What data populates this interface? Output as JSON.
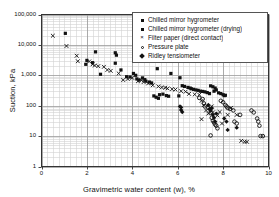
{
  "chart_data": {
    "type": "scatter",
    "title": "",
    "xlabel": "Gravimetric water content (w), %",
    "ylabel": "Suction, kPa",
    "xlim": [
      0,
      10
    ],
    "ylim": [
      1,
      100000
    ],
    "yscale": "log",
    "xscale": "linear",
    "grid": true,
    "grid_minor": true,
    "legend_position": "top-right",
    "xticks": [
      "0",
      "2",
      "4",
      "6",
      "8",
      "10"
    ],
    "xtick_values": [
      0,
      2,
      4,
      6,
      8,
      10
    ],
    "yticks": [
      "1",
      "10",
      "100",
      "1,000",
      "10,000",
      "100,000"
    ],
    "ytick_values": [
      1,
      10,
      100,
      1000,
      10000,
      100000
    ],
    "series": [
      {
        "name": "Chilled mirror hygrometer",
        "marker": "filled-square",
        "color": "#111111",
        "points": [
          [
            1.05,
            24000
          ],
          [
            2.38,
            5900
          ],
          [
            3.25,
            5500
          ],
          [
            3.3,
            4600
          ],
          [
            2.0,
            3100
          ],
          [
            2.25,
            2600
          ],
          [
            1.95,
            2300
          ],
          [
            2.6,
            1080
          ],
          [
            3.25,
            2500
          ],
          [
            3.5,
            1500
          ],
          [
            3.75,
            900
          ],
          [
            3.9,
            880
          ],
          [
            4.05,
            1150
          ],
          [
            4.15,
            1000
          ],
          [
            4.2,
            760
          ],
          [
            4.3,
            700
          ],
          [
            4.45,
            820
          ],
          [
            4.55,
            720
          ],
          [
            4.6,
            640
          ],
          [
            4.75,
            600
          ],
          [
            4.85,
            560
          ],
          [
            5.1,
            1650
          ],
          [
            5.7,
            1150
          ],
          [
            6.1,
            830
          ],
          [
            4.95,
            210
          ],
          [
            5.05,
            190
          ],
          [
            5.15,
            175
          ],
          [
            5.2,
            230
          ],
          [
            5.35,
            240
          ],
          [
            5.5,
            215
          ],
          [
            5.6,
            205
          ],
          [
            6.05,
            210
          ],
          [
            6.3,
            430
          ],
          [
            6.45,
            400
          ],
          [
            6.55,
            380
          ],
          [
            6.6,
            360
          ],
          [
            6.7,
            345
          ],
          [
            6.8,
            330
          ],
          [
            6.9,
            320
          ],
          [
            7.0,
            300
          ],
          [
            7.1,
            295
          ],
          [
            7.2,
            285
          ],
          [
            7.3,
            270
          ],
          [
            7.4,
            250
          ],
          [
            6.2,
            455
          ],
          [
            7.55,
            420
          ],
          [
            7.6,
            300
          ],
          [
            7.7,
            330
          ],
          [
            7.8,
            265
          ],
          [
            8.0,
            230
          ],
          [
            8.05,
            215
          ]
        ]
      },
      {
        "name": "Chilled mirror hygrometer (drying)",
        "marker": "filled-square",
        "color": "#111111",
        "points": [
          [
            7.45,
            450
          ],
          [
            7.65,
            380
          ],
          [
            7.9,
            250
          ],
          [
            8.1,
            220
          ]
        ]
      },
      {
        "name": "Filter paper (direct contact)",
        "marker": "x",
        "color": "#111111",
        "points": [
          [
            0.5,
            20000
          ],
          [
            1.1,
            9200
          ],
          [
            1.55,
            4400
          ],
          [
            1.6,
            2900
          ],
          [
            2.1,
            2850
          ],
          [
            2.25,
            2300
          ],
          [
            2.35,
            2100
          ],
          [
            2.5,
            2000
          ],
          [
            2.75,
            1900
          ],
          [
            2.9,
            1500
          ],
          [
            3.05,
            1400
          ],
          [
            3.4,
            1150
          ],
          [
            3.6,
            700
          ],
          [
            3.8,
            760
          ],
          [
            4.0,
            820
          ],
          [
            4.25,
            640
          ],
          [
            4.4,
            690
          ],
          [
            4.5,
            600
          ],
          [
            4.7,
            540
          ],
          [
            4.9,
            470
          ],
          [
            5.15,
            430
          ],
          [
            5.3,
            400
          ],
          [
            5.45,
            390
          ],
          [
            5.55,
            370
          ],
          [
            5.75,
            350
          ],
          [
            5.9,
            340
          ],
          [
            6.15,
            300
          ],
          [
            6.35,
            290
          ],
          [
            6.5,
            245
          ],
          [
            6.75,
            235
          ],
          [
            6.95,
            230
          ],
          [
            7.05,
            145
          ],
          [
            7.15,
            105
          ],
          [
            7.25,
            70
          ],
          [
            7.35,
            55
          ],
          [
            7.5,
            95
          ],
          [
            7.55,
            60
          ],
          [
            7.75,
            48
          ],
          [
            7.85,
            62
          ],
          [
            8.2,
            50
          ],
          [
            8.35,
            85
          ],
          [
            8.6,
            50
          ],
          [
            8.8,
            7
          ],
          [
            8.95,
            6.5
          ],
          [
            9.05,
            6.5
          ],
          [
            7.95,
            26
          ],
          [
            7.05,
            36
          ]
        ]
      },
      {
        "name": "Pressure plate",
        "marker": "open-circle",
        "color": "#111111",
        "points": [
          [
            6.95,
            180
          ],
          [
            7.1,
            165
          ],
          [
            7.15,
            120
          ],
          [
            7.2,
            95
          ],
          [
            7.35,
            85
          ],
          [
            7.45,
            60
          ],
          [
            7.5,
            40
          ],
          [
            7.55,
            32
          ],
          [
            7.6,
            28
          ],
          [
            7.65,
            24
          ],
          [
            7.7,
            22
          ],
          [
            7.75,
            18
          ],
          [
            7.9,
            145
          ],
          [
            8.0,
            130
          ],
          [
            8.1,
            105
          ],
          [
            8.15,
            95
          ],
          [
            8.2,
            85
          ],
          [
            8.3,
            78
          ],
          [
            8.45,
            70
          ],
          [
            8.5,
            30
          ],
          [
            8.6,
            26
          ],
          [
            9.25,
            70
          ],
          [
            9.35,
            60
          ],
          [
            9.5,
            38
          ],
          [
            9.55,
            30
          ],
          [
            9.6,
            22
          ],
          [
            9.65,
            10
          ],
          [
            9.75,
            10
          ],
          [
            7.45,
            10.5
          ],
          [
            8.75,
            50
          ]
        ]
      },
      {
        "name": "Ridley tensiometer",
        "marker": "filled-diamond",
        "color": "#111111",
        "points": [
          [
            6.1,
            95
          ],
          [
            6.15,
            72
          ],
          [
            6.2,
            62
          ],
          [
            6.15,
            88
          ],
          [
            7.35,
            105
          ],
          [
            7.4,
            78
          ],
          [
            7.45,
            68
          ],
          [
            7.5,
            82
          ],
          [
            7.55,
            50
          ],
          [
            7.6,
            40
          ],
          [
            7.65,
            30
          ],
          [
            7.7,
            55
          ],
          [
            8.05,
            38
          ],
          [
            8.15,
            30
          ],
          [
            8.2,
            16
          ],
          [
            8.6,
            19
          ]
        ]
      }
    ]
  },
  "legend": {
    "items": [
      {
        "label": "Chilled mirror hygrometer",
        "marker": "filled-square"
      },
      {
        "label": "Chilled mirror hygrometer (drying)",
        "marker": "filled-square"
      },
      {
        "label": "Filter paper (direct contact)",
        "marker": "x"
      },
      {
        "label": "Pressure plate",
        "marker": "open-circle"
      },
      {
        "label": "Ridley tensiometer",
        "marker": "filled-diamond"
      }
    ]
  },
  "colors": {
    "marker": "#111111",
    "axis": "#333333",
    "grid_major": "#9a9a9a",
    "grid_minor": "#d2d2d2",
    "background": "#ffffff"
  }
}
